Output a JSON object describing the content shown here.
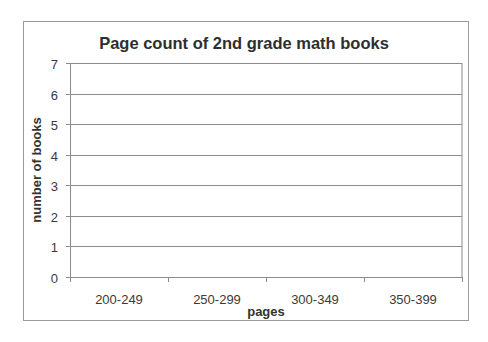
{
  "chart_data": {
    "type": "bar",
    "title": "Page count of 2nd grade math books",
    "xlabel": "pages",
    "ylabel": "number of books",
    "categories": [
      "200-249",
      "250-299",
      "300-349",
      "350-399"
    ],
    "values": [
      0,
      0,
      0,
      0
    ],
    "ylim": [
      0,
      7
    ],
    "yticks": [
      0,
      1,
      2,
      3,
      4,
      5,
      6,
      7
    ],
    "grid": true,
    "legend": "none"
  },
  "colors": {
    "gridline": "#8c8c8c",
    "axis": "#8c8c8c",
    "frame": "#9a9a9a",
    "text": "#333333"
  }
}
